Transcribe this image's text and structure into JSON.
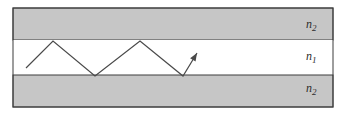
{
  "diagram": {
    "labels": {
      "top_cladding": {
        "base": "n",
        "sub": "2"
      },
      "core": {
        "base": "n",
        "sub": "1"
      },
      "bottom_cladding": {
        "base": "n",
        "sub": "2"
      }
    },
    "colors": {
      "background": "#ffffff",
      "cladding_fill": "#c6c6c6",
      "core_fill": "#ffffff",
      "outline": "#3d3d3d",
      "ray": "#4a4a4a"
    },
    "geometry": {
      "canvas": {
        "width": 341,
        "height": 114
      },
      "outer_rect": {
        "x": 13,
        "y": 8,
        "width": 320,
        "height": 99
      },
      "top_band": {
        "x": 13,
        "y": 8,
        "width": 320,
        "height": 32
      },
      "core_band": {
        "x": 13,
        "y": 40,
        "width": 320,
        "height": 35
      },
      "bottom_band": {
        "x": 13,
        "y": 75,
        "width": 320,
        "height": 32
      },
      "ray_points": [
        [
          26,
          68
        ],
        [
          53,
          41
        ],
        [
          95,
          76
        ],
        [
          140,
          41
        ],
        [
          183,
          76
        ],
        [
          197,
          53
        ]
      ],
      "arrowhead": {
        "length": 8,
        "half_width": 3.2
      }
    }
  }
}
